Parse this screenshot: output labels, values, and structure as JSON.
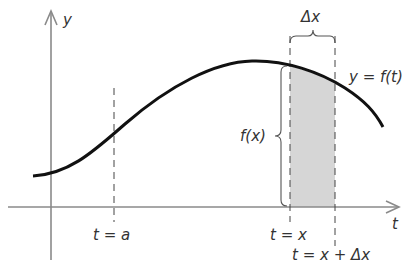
{
  "diagram": {
    "axes": {
      "y_label": "y",
      "x_label": "t"
    },
    "curve_label": "y = f(t)",
    "height_label": "f(x)",
    "width_label": "Δx",
    "markers": [
      {
        "label": "t = a"
      },
      {
        "label": "t = x"
      },
      {
        "label": "t = x + Δx"
      }
    ],
    "colors": {
      "curve": "#111111",
      "axes": "#8a8a8a",
      "shade": "#d6d6d6",
      "text": "#333333"
    }
  }
}
